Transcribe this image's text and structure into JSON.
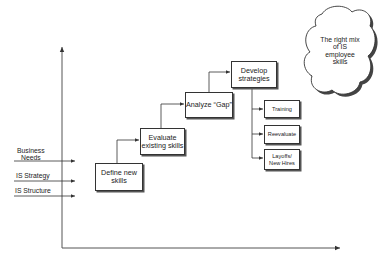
{
  "inputs": [
    {
      "label_line1": "Business",
      "label_line2": "Needs"
    },
    {
      "label": "IS Strategy"
    },
    {
      "label": "IS Structure"
    }
  ],
  "steps": [
    {
      "line1": "Define new",
      "line2": "skills"
    },
    {
      "line1": "Evaluate",
      "line2": "existing skills"
    },
    {
      "line1": "Analyze “Gap”"
    },
    {
      "line1": "Develop",
      "line2": "strategies"
    }
  ],
  "outcomes": [
    {
      "line1": "Training"
    },
    {
      "line1": "Reevaluate"
    },
    {
      "line1": "Layoffs/",
      "line2": "New Hires"
    }
  ],
  "goal": {
    "line1": "The right mix",
    "line2": "of IS",
    "line3": "employee",
    "line4": "skills"
  },
  "colors": {
    "line": "#333333",
    "shadow": "#555555",
    "background": "#ffffff"
  }
}
